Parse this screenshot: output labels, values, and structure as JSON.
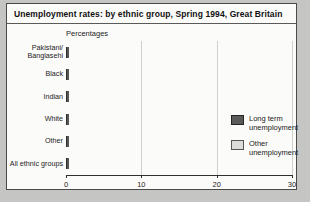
{
  "title": "Unemployment rates: by ethnic group, Spring 1994, Great Britain",
  "chart_data": {
    "type": "bar",
    "orientation": "horizontal",
    "stacked": true,
    "title": "Unemployment rates: by ethnic group, Spring 1994, Great Britain",
    "unit_label": "Percentages",
    "categories": [
      "Pakistani/\nBanglasehi",
      "Black",
      "Indian",
      "White",
      "Other",
      "All ethnic groups"
    ],
    "series": [
      {
        "name": "Long term unemployment",
        "color": "#5a5a5a",
        "values": [
          15.5,
          16,
          7,
          3.5,
          8,
          4
        ]
      },
      {
        "name": "Other unemployment",
        "color": "#dcdcda",
        "values": [
          12.5,
          12.5,
          7,
          5.5,
          11.5,
          5.5
        ]
      }
    ],
    "totals": [
      28,
      28.5,
      14,
      9,
      19.5,
      9.5
    ],
    "xlabel": "",
    "ylabel": "",
    "xlim": [
      0,
      30
    ],
    "xticks": [
      0,
      10,
      20,
      30
    ],
    "grid": true,
    "legend_position": "right-inside"
  },
  "colors": {
    "long_term_unemployment": "#5a5a5a",
    "other_unemployment": "#dcdcda",
    "panel_background": "#fbfbfa",
    "page_background": "#c5c6c4",
    "panel_border": "#4a4a4a",
    "gridline": "#cfd0cf"
  }
}
